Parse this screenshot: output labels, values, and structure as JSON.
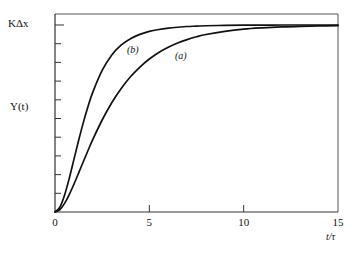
{
  "figure": {
    "background_color": "#ffffff",
    "line_color": "#111111",
    "axis_color": "#444444"
  },
  "axes": {
    "y_axis_label": "Y(t)",
    "y_top_label": "KΔx",
    "x_axis_label": "t/τ",
    "x_ticks": [
      "0",
      "5",
      "10",
      "15"
    ],
    "x_tick_values": [
      0,
      5,
      10,
      15
    ],
    "y_minor_tick_count": 10,
    "frame_top": true,
    "frame_right": true
  },
  "annotations": {
    "curve_a_label": "(a)",
    "curve_b_label": "(b)"
  },
  "chart_data": {
    "type": "line",
    "title": "",
    "subtitle": "",
    "xlabel": "t/τ",
    "ylabel": "Y(t)",
    "xlim": [
      0,
      15
    ],
    "ylim": [
      0,
      1.0
    ],
    "ytop_label": "KΔx",
    "grid": false,
    "legend": "inline-annotations",
    "x": [
      0,
      0.25,
      0.5,
      0.75,
      1,
      1.25,
      1.5,
      1.75,
      2,
      2.5,
      3,
      3.5,
      4,
      4.5,
      5,
      5.5,
      6,
      6.5,
      7,
      7.5,
      8,
      9,
      10,
      11,
      12,
      13,
      14,
      15
    ],
    "series": [
      {
        "name": "(a)",
        "label": "(a)",
        "description": "slower overdamped second-order step response",
        "values": [
          0,
          0.012,
          0.045,
          0.092,
          0.148,
          0.208,
          0.269,
          0.329,
          0.387,
          0.492,
          0.583,
          0.659,
          0.723,
          0.775,
          0.818,
          0.853,
          0.881,
          0.904,
          0.922,
          0.937,
          0.949,
          0.966,
          0.978,
          0.985,
          0.99,
          0.993,
          0.995,
          0.997
        ]
      },
      {
        "name": "(b)",
        "label": "(b)",
        "description": "faster overdamped second-order step response",
        "values": [
          0,
          0.024,
          0.088,
          0.178,
          0.28,
          0.382,
          0.478,
          0.564,
          0.64,
          0.757,
          0.838,
          0.892,
          0.927,
          0.95,
          0.966,
          0.976,
          0.983,
          0.988,
          0.992,
          0.994,
          0.996,
          0.998,
          0.999,
          0.999,
          1.0,
          1.0,
          1.0,
          1.0
        ]
      }
    ]
  }
}
